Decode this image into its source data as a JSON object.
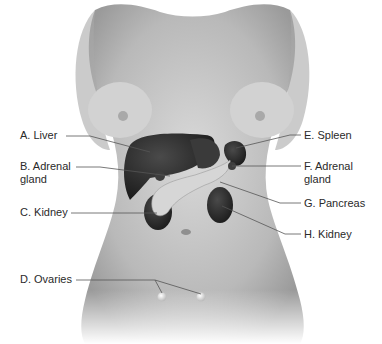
{
  "figure": {
    "labels": {
      "A": {
        "text": "A. Liver"
      },
      "B": {
        "text": "B. Adrenal",
        "text2": "gland"
      },
      "C": {
        "text": "C. Kidney"
      },
      "D": {
        "text": "D. Ovaries"
      },
      "E": {
        "text": "E. Spleen"
      },
      "F": {
        "text": "F. Adrenal",
        "text2": "gland"
      },
      "G": {
        "text": "G. Pancreas"
      },
      "H": {
        "text": "H. Kidney"
      }
    },
    "colors": {
      "skin": "#c9c9c9",
      "organ": "#2b2b2b",
      "pancreas": "#d6d6d6",
      "leader_line": "#555555",
      "text": "#2a2a2a"
    }
  }
}
